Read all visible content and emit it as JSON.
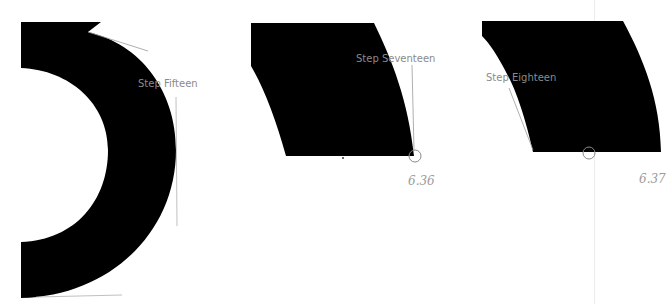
{
  "diagram": {
    "panels": [
      {
        "id": "step-fifteen",
        "label": "Step Fifteen"
      },
      {
        "id": "step-seventeen",
        "label": "Step Seventeen",
        "page": "6.36"
      },
      {
        "id": "step-eighteen",
        "label": "Step Eighteen",
        "page": "6.37"
      }
    ],
    "colors": {
      "glyph_fill": "#000000",
      "guide_line": "#9a9a9a",
      "label_text": "#8a8a8a",
      "page_divider": "#ececec"
    }
  }
}
